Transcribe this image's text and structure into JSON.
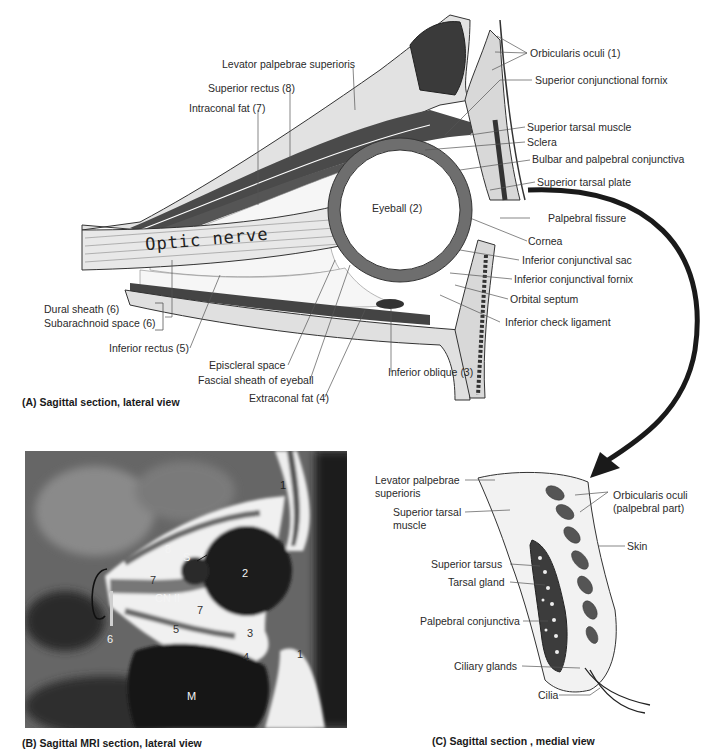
{
  "panel_a": {
    "caption": "(A) Sagittal section, lateral view",
    "optic_nerve_text": "Optic nerve",
    "labels": {
      "orbicularis_oculi": "Orbicularis oculi (1)",
      "levator": "Levator palpebrae superioris",
      "superior_conj_fornix": "Superior conjunctional fornix",
      "superior_rectus": "Superior rectus (8)",
      "intraconal_fat": "Intraconal fat (7)",
      "superior_tarsal_muscle": "Superior tarsal muscle",
      "sclera": "Sclera",
      "bulbar_palpebral": "Bulbar and palpebral conjunctiva",
      "superior_tarsal_plate": "Superior tarsal plate",
      "eyeball": "Eyeball (2)",
      "palpebral_fissure": "Palpebral fissure",
      "cornea": "Cornea",
      "inferior_conj_sac": "Inferior conjunctival sac",
      "inferior_conj_fornix": "Inferior conjunctival fornix",
      "orbital_septum": "Orbital septum",
      "inferior_check_ligament": "Inferior check ligament",
      "dural_sheath": "Dural sheath (6)",
      "subarachnoid": "Subarachnoid space (6)",
      "inferior_rectus": "Inferior rectus (5)",
      "episcleral": "Episcleral space",
      "fascial_sheath": "Fascial sheath of eyeball",
      "extraconal_fat": "Extraconal fat (4)",
      "inferior_oblique": "Inferior oblique (3)"
    }
  },
  "panel_b": {
    "caption": "(B) Sagittal MRI section, lateral view",
    "markers": {
      "m1_top": "1",
      "m1_bottom": "1",
      "m2": "2",
      "m3": "3",
      "m4": "4",
      "m5": "5",
      "m6": "6",
      "m7_upper": "7",
      "m7_lower": "7",
      "m8": "8",
      "s": "S",
      "cn2": "CN II",
      "m": "M"
    }
  },
  "panel_c": {
    "caption": "(C) Sagittal section , medial view",
    "labels": {
      "levator_line1": "Levator palpebrae",
      "levator_line2": "superioris",
      "sup_tarsal_muscle_line1": "Superior tarsal",
      "sup_tarsal_muscle_line2": "muscle",
      "orbicularis_line1": "Orbicularis oculi",
      "orbicularis_line2": "(palpebral part)",
      "skin": "Skin",
      "superior_tarsus": "Superior tarsus",
      "tarsal_gland": "Tarsal gland",
      "palpebral_conjunctiva": "Palpebral conjunctiva",
      "ciliary_glands": "Ciliary glands",
      "cilia": "Cilia"
    }
  },
  "colors": {
    "ink": "#2a2a2a",
    "muscle": "#4a4a4a",
    "fat": "#f4f4f4",
    "sclera": "#8a8a8a",
    "mri_bg": "#5c5c5c",
    "arrow": "#1a1a1a"
  }
}
